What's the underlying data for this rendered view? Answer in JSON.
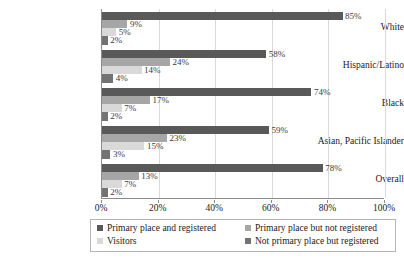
{
  "chart_data": {
    "type": "bar",
    "orientation": "horizontal",
    "title": "",
    "subtitle": "",
    "xlabel": "",
    "ylabel": "",
    "xlim": [
      0,
      100
    ],
    "xticks": [
      "0%",
      "20%",
      "40%",
      "60%",
      "80%",
      "100%"
    ],
    "xtick_values": [
      0,
      20,
      40,
      60,
      80,
      100
    ],
    "grid": true,
    "grid_axis": "x",
    "legend_position": "bottom",
    "value_suffix": "%",
    "categories": [
      "White",
      "Hispanic/Latino",
      "Black",
      "Asian, Pacific Islander",
      "Overall"
    ],
    "series": [
      {
        "name": "Primary place and registered",
        "color": "#595959",
        "values": [
          85,
          58,
          74,
          59,
          78
        ],
        "labels": [
          "85%",
          "58%",
          "74%",
          "59%",
          "78%"
        ]
      },
      {
        "name": "Primary place but not registered",
        "color": "#a6a6a6",
        "values": [
          9,
          24,
          17,
          23,
          13
        ],
        "labels": [
          "9%",
          "24%",
          "17%",
          "23%",
          "13%"
        ]
      },
      {
        "name": "Visitors",
        "color": "#d9d9d9",
        "values": [
          5,
          14,
          7,
          15,
          7
        ],
        "labels": [
          "5%",
          "14%",
          "7%",
          "15%",
          "7%"
        ]
      },
      {
        "name": "Not primary place but registered",
        "color": "#737373",
        "values": [
          2,
          4,
          2,
          3,
          2
        ],
        "labels": [
          "2%",
          "4%",
          "2%",
          "3%",
          "2%"
        ]
      }
    ]
  },
  "legend": {
    "entries": [
      {
        "label": "Primary place and registered",
        "color": "#595959"
      },
      {
        "label": "Primary place but not registered",
        "color": "#a6a6a6"
      },
      {
        "label": "Visitors",
        "color": "#d9d9d9"
      },
      {
        "label": "Not primary place but registered",
        "color": "#737373"
      }
    ]
  },
  "axis": {
    "x_ticks": [
      "0%",
      "20%",
      "40%",
      "60%",
      "80%",
      "100%"
    ],
    "y_categories": [
      "White",
      "Hispanic/Latino",
      "Black",
      "Asian, Pacific Islander",
      "Overall"
    ]
  },
  "colors": {
    "series_1": "#595959",
    "series_2": "#a6a6a6",
    "series_3": "#d9d9d9",
    "series_4": "#737373",
    "gridline": "#d9d9d9",
    "axis": "#8c8c8c",
    "text": "#1a1a1a"
  }
}
